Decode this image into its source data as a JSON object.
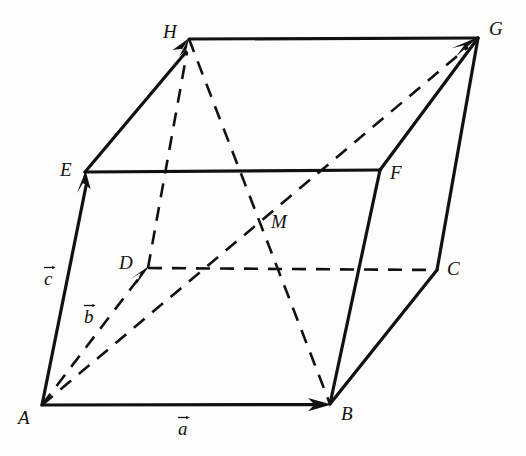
{
  "figure": {
    "background_color": "#fdfdfb",
    "ink_color": "#111111",
    "solid_stroke_width": 3,
    "dashed_stroke_width": 2.6,
    "dash_pattern": "14 10",
    "vertices": [
      {
        "id": "A",
        "label": "A",
        "x": 42,
        "y": 405,
        "label_x": 18,
        "label_y": 408
      },
      {
        "id": "B",
        "label": "B",
        "x": 330,
        "y": 404,
        "label_x": 341,
        "label_y": 404
      },
      {
        "id": "C",
        "label": "C",
        "x": 437,
        "y": 270,
        "label_x": 447,
        "label_y": 259
      },
      {
        "id": "D",
        "label": "D",
        "x": 148,
        "y": 268,
        "label_x": 119,
        "label_y": 253
      },
      {
        "id": "E",
        "label": "E",
        "x": 85,
        "y": 172,
        "label_x": 60,
        "label_y": 160
      },
      {
        "id": "F",
        "label": "F",
        "x": 380,
        "y": 170,
        "label_x": 390,
        "label_y": 163
      },
      {
        "id": "G",
        "label": "G",
        "x": 478,
        "y": 38,
        "label_x": 489,
        "label_y": 19
      },
      {
        "id": "H",
        "label": "H",
        "x": 189,
        "y": 39,
        "label_x": 163,
        "label_y": 22
      },
      {
        "id": "M",
        "label": "M",
        "x": 262,
        "y": 222,
        "label_x": 271,
        "label_y": 212
      }
    ],
    "solid_edges": [
      {
        "name": "edge-AB",
        "from": "A",
        "to": "B"
      },
      {
        "name": "edge-AE",
        "from": "A",
        "to": "E"
      },
      {
        "name": "edge-EF",
        "from": "E",
        "to": "F"
      },
      {
        "name": "edge-EH",
        "from": "E",
        "to": "H"
      },
      {
        "name": "edge-HG",
        "from": "H",
        "to": "G"
      },
      {
        "name": "edge-FG",
        "from": "F",
        "to": "G"
      },
      {
        "name": "edge-BF",
        "from": "B",
        "to": "F"
      },
      {
        "name": "edge-BC",
        "from": "B",
        "to": "C"
      },
      {
        "name": "edge-CG",
        "from": "C",
        "to": "G"
      }
    ],
    "dashed_edges": [
      {
        "name": "edge-AD",
        "from": "A",
        "to": "D"
      },
      {
        "name": "edge-DC",
        "from": "D",
        "to": "C"
      },
      {
        "name": "edge-DH",
        "from": "D",
        "to": "H"
      },
      {
        "name": "diagonal-HB",
        "from": "H",
        "to": "B"
      },
      {
        "name": "diagonal-AG",
        "from": "A",
        "to": "G"
      }
    ],
    "arrows": [
      {
        "name": "arrow-a-head",
        "at": "B",
        "from": "A",
        "style": "solid"
      },
      {
        "name": "arrow-c-head",
        "at": "E",
        "from": "A",
        "style": "solid"
      },
      {
        "name": "arrow-b-head",
        "at": "D",
        "from": "A",
        "style": "dashed"
      },
      {
        "name": "arrow-ag-head",
        "at": "G",
        "from": "A",
        "style": "dashed"
      },
      {
        "name": "arrow-eh-head",
        "at": "H",
        "from": "E",
        "style": "solid"
      },
      {
        "name": "arrow-dh-head",
        "at": "H",
        "from": "D",
        "style": "dashed"
      }
    ],
    "vector_labels": [
      {
        "id": "a",
        "label": "a",
        "x": 178,
        "y": 417,
        "name": "vector-label-a"
      },
      {
        "id": "b",
        "label": "b",
        "x": 84,
        "y": 305,
        "name": "vector-label-b"
      },
      {
        "id": "c",
        "label": "c",
        "x": 44,
        "y": 267,
        "name": "vector-label-c"
      }
    ]
  }
}
